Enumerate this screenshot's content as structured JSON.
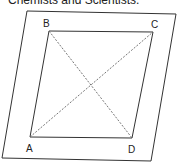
{
  "caption": "Chemists and Scientists.",
  "diagram": {
    "outer_plane": {
      "points": [
        [
          27,
          11
        ],
        [
          176,
          14
        ],
        [
          151,
          161
        ],
        [
          2,
          158
        ]
      ]
    },
    "square": {
      "vertices": {
        "A": [
          30,
          137
        ],
        "B": [
          49,
          31
        ],
        "C": [
          153,
          32
        ],
        "D": [
          132,
          138
        ]
      }
    },
    "labels": [
      {
        "id": "B",
        "text": "B",
        "x": 43,
        "y": 27
      },
      {
        "id": "C",
        "text": "C",
        "x": 151,
        "y": 28
      },
      {
        "id": "A",
        "text": "A",
        "x": 26,
        "y": 152
      },
      {
        "id": "D",
        "text": "D",
        "x": 128,
        "y": 153
      }
    ],
    "diagonals": [
      "AC",
      "BD"
    ],
    "colors": {
      "line": "#333333",
      "dashed": "#666666",
      "text": "#222222"
    }
  }
}
